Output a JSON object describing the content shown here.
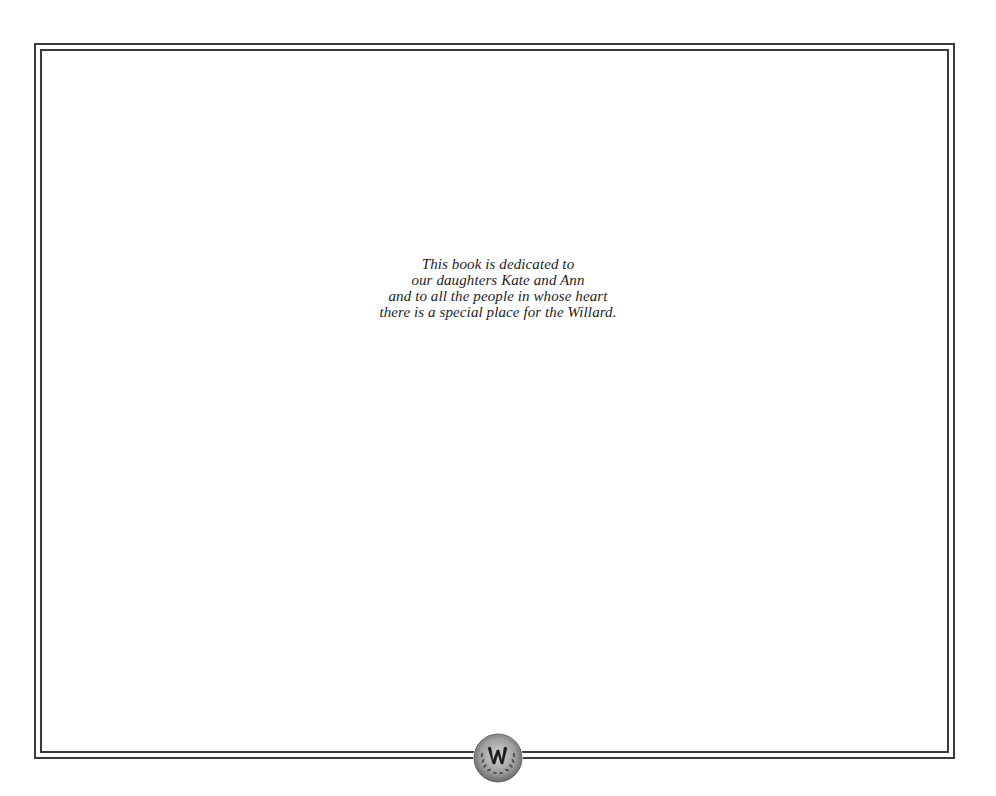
{
  "page": {
    "background_color": "#ffffff",
    "border_color": "#3a3a3a",
    "text_color": "#1e1e1e"
  },
  "dedication": {
    "lines": [
      "This book is dedicated to",
      "our daughters Kate and Ann",
      "and to all the people in whose heart",
      "there is a special place for the Willard."
    ]
  },
  "medallion": {
    "icon": "willard-monogram-seal-icon",
    "monogram": "W"
  }
}
